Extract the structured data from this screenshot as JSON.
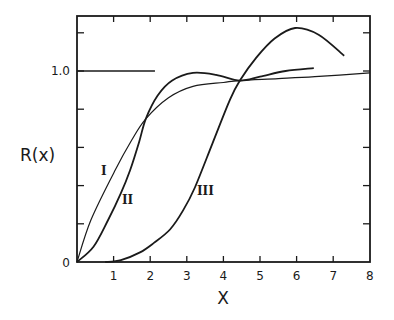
{
  "chart_data": {
    "type": "line",
    "title": "",
    "xlabel": "X",
    "ylabel": "R(x)",
    "xlim": [
      0,
      8
    ],
    "ylim": [
      0,
      1.29
    ],
    "grid": false,
    "legend": "none (curves labeled inline with roman numerals)",
    "x_ticks": [
      1,
      2,
      3,
      4,
      5,
      6,
      7,
      8
    ],
    "x_tick_labels": [
      "1",
      "2",
      "3",
      "4",
      "5",
      "6",
      "7",
      "8"
    ],
    "y_ticks": [
      0,
      0.2,
      0.4,
      0.6,
      0.8,
      1.0,
      1.2
    ],
    "y_tick_labels": [
      {
        "value": 0,
        "label": "0"
      },
      {
        "value": 1.0,
        "label": "1.0"
      }
    ],
    "reference_line": {
      "y": 1.0,
      "x_from": 0,
      "x_to": 2.13
    },
    "series": [
      {
        "name": "I",
        "label_pos": [
          0.77,
          0.48
        ],
        "stroke_width": 1.2,
        "x": [
          0,
          0.38,
          1.04,
          1.5,
          1.88,
          2.5,
          3.17,
          4.0,
          4.45,
          5.5,
          6.5,
          8.0
        ],
        "y": [
          0,
          0.22,
          0.48,
          0.64,
          0.75,
          0.86,
          0.92,
          0.94,
          0.95,
          0.96,
          0.97,
          0.99
        ]
      },
      {
        "name": "II",
        "label_pos": [
          1.4,
          0.32
        ],
        "stroke_width": 1.8,
        "x": [
          0,
          0.45,
          0.85,
          1.2,
          1.45,
          1.7,
          1.88,
          2.2,
          2.6,
          3.17,
          3.8,
          4.45,
          5.0,
          5.7,
          6.47
        ],
        "y": [
          0,
          0.08,
          0.22,
          0.36,
          0.48,
          0.63,
          0.75,
          0.87,
          0.95,
          0.99,
          0.98,
          0.95,
          0.97,
          1.0,
          1.015
        ]
      },
      {
        "name": "III",
        "label_pos": [
          3.3,
          0.37
        ],
        "stroke_width": 1.8,
        "x": [
          0.77,
          1.2,
          1.72,
          2.1,
          2.54,
          2.9,
          3.22,
          3.7,
          4.18,
          4.45,
          4.9,
          5.4,
          5.96,
          6.6,
          7.3
        ],
        "y": [
          0,
          0.01,
          0.05,
          0.1,
          0.17,
          0.27,
          0.39,
          0.62,
          0.85,
          0.95,
          1.07,
          1.17,
          1.225,
          1.19,
          1.08
        ]
      }
    ]
  },
  "labels": {
    "ylabel": "R(x)",
    "xlabel": "X",
    "origin": "0",
    "y_one": "1.0",
    "series_I": "I",
    "series_II": "II",
    "series_III": "III"
  }
}
